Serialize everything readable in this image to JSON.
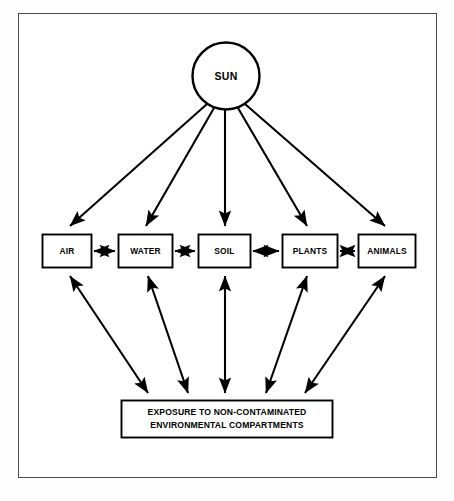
{
  "figure": {
    "source_node": {
      "id": "sun",
      "label": "SUN",
      "shape": "circle"
    },
    "compartments": [
      {
        "id": "air",
        "label": "AIR"
      },
      {
        "id": "water",
        "label": "WATER"
      },
      {
        "id": "soil",
        "label": "SOIL"
      },
      {
        "id": "plants",
        "label": "PLANTS"
      },
      {
        "id": "animals",
        "label": "ANIMALS"
      }
    ],
    "sink_node": {
      "id": "exposure",
      "line1": "EXPOSURE TO NON-CONTAMINATED",
      "line2": "ENVIRONMENTAL COMPARTMENTS"
    },
    "caption": "",
    "colors": {
      "stroke": "#000000",
      "fill": "#ffffff",
      "frame": "#4a4a4a",
      "page": "#fefefe"
    },
    "edges": {
      "sun_to_compartments": "one-way arrow downward from SUN to each compartment",
      "between_compartments": "double-headed horizontal arrows linking adjacent compartments",
      "compartments_to_exposure": "double-headed arrows between each compartment and the exposure box"
    }
  }
}
